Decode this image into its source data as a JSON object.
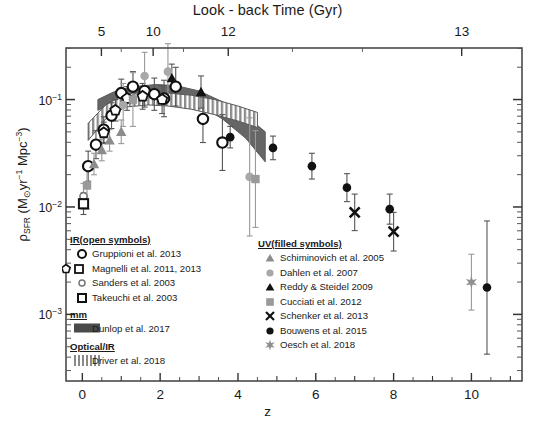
{
  "chart_data": {
    "type": "scatter",
    "title": "Look - back Time (Gyr)",
    "xlabel": "z",
    "ylabel_parts": {
      "rho": "ρ",
      "sfr": "SFR",
      "units_open": " (M",
      "sun": "⊙",
      "yr": "yr",
      "yr_exp": "-1",
      "mpc": " Mpc",
      "mpc_exp": "-3",
      "units_close": ")"
    },
    "xlim": [
      -0.42,
      11.3
    ],
    "ylim_log": [
      -3.62,
      -0.52
    ],
    "xticks_major": [
      0,
      2,
      4,
      6,
      8,
      10
    ],
    "xticks_minor": [
      1,
      3,
      5,
      7,
      9,
      11
    ],
    "xtick_labels": [
      "0",
      "2",
      "4",
      "6",
      "8",
      "10"
    ],
    "yticks_major_log": [
      -1,
      -2,
      -3
    ],
    "ytick_labels": [
      "10⁻¹",
      "10⁻²",
      "10⁻³"
    ],
    "top_axis": {
      "label": "Look - back Time (Gyr)",
      "ticks_z": [
        0.49,
        1.82,
        3.75,
        9.75
      ],
      "tick_labels": [
        "5",
        "10",
        "12",
        "13"
      ],
      "minor_ticks_z": [
        1.0,
        2.6,
        5.4,
        7.2
      ]
    },
    "grid": false,
    "legend_position": "inside-lower-left and inside-lower-center",
    "bands": [
      {
        "name": "Dunlop et al. 2017",
        "style": "dark-gray-filled",
        "color": "#595959",
        "upper_log": [
          [
            0.4,
            -1.0
          ],
          [
            0.8,
            -0.93
          ],
          [
            1.3,
            -0.88
          ],
          [
            1.9,
            -0.86
          ],
          [
            2.4,
            -0.87
          ],
          [
            3.0,
            -0.92
          ],
          [
            3.6,
            -1.02
          ],
          [
            4.2,
            -1.15
          ],
          [
            4.7,
            -1.3
          ]
        ],
        "lower_log": [
          [
            0.4,
            -1.1
          ],
          [
            0.8,
            -1.03
          ],
          [
            1.3,
            -0.98
          ],
          [
            1.9,
            -0.96
          ],
          [
            2.4,
            -0.98
          ],
          [
            3.0,
            -1.05
          ],
          [
            3.6,
            -1.18
          ],
          [
            4.2,
            -1.36
          ],
          [
            4.7,
            -1.58
          ]
        ]
      },
      {
        "name": "Driver et al. 2018",
        "style": "vertical-hatch",
        "color": "#7a7a7a",
        "upper_log": [
          [
            0.15,
            -1.22
          ],
          [
            0.6,
            -1.05
          ],
          [
            1.1,
            -0.95
          ],
          [
            1.7,
            -0.93
          ],
          [
            2.2,
            -0.94
          ],
          [
            2.8,
            -0.96
          ],
          [
            3.4,
            -1.0
          ],
          [
            4.0,
            -1.06
          ],
          [
            4.5,
            -1.12
          ]
        ],
        "lower_log": [
          [
            0.15,
            -1.38
          ],
          [
            0.6,
            -1.18
          ],
          [
            1.1,
            -1.07
          ],
          [
            1.7,
            -1.05
          ],
          [
            2.2,
            -1.06
          ],
          [
            2.8,
            -1.09
          ],
          [
            3.4,
            -1.14
          ],
          [
            4.0,
            -1.2
          ],
          [
            4.5,
            -1.26
          ]
        ]
      }
    ],
    "series": [
      {
        "name": "Gruppioni et al. 2013",
        "group": "IR (open symbols)",
        "marker": "open-circle",
        "color": "#111111",
        "points": [
          {
            "z": 0.15,
            "log_y": -1.62,
            "err_lo": 0.14,
            "err_hi": 0.14
          },
          {
            "z": 0.35,
            "log_y": -1.42,
            "err_lo": 0.13,
            "err_hi": 0.13
          },
          {
            "z": 0.55,
            "log_y": -1.28,
            "err_lo": 0.12,
            "err_hi": 0.12
          },
          {
            "z": 0.75,
            "log_y": -1.15,
            "err_lo": 0.12,
            "err_hi": 0.12
          },
          {
            "z": 1.0,
            "log_y": -0.94,
            "err_lo": 0.13,
            "err_hi": 0.13
          },
          {
            "z": 1.3,
            "log_y": -0.88,
            "err_lo": 0.14,
            "err_hi": 0.14
          },
          {
            "z": 1.6,
            "log_y": -0.92,
            "err_lo": 0.15,
            "err_hi": 0.15
          },
          {
            "z": 1.85,
            "log_y": -0.95,
            "err_lo": 0.15,
            "err_hi": 0.15
          },
          {
            "z": 2.1,
            "log_y": -0.99,
            "err_lo": 0.17,
            "err_hi": 0.17
          },
          {
            "z": 2.4,
            "log_y": -0.88,
            "err_lo": 0.18,
            "err_hi": 0.18
          },
          {
            "z": 3.1,
            "log_y": -1.18,
            "err_lo": 0.22,
            "err_hi": 0.22
          },
          {
            "z": 3.6,
            "log_y": -1.4,
            "err_lo": 0.26,
            "err_hi": 0.26
          }
        ]
      },
      {
        "name": "Magnelli et al. 2011, 2013",
        "group": "IR (open symbols)",
        "marker": "open-pentagon",
        "color": "#111111",
        "points": [
          {
            "z": 0.55,
            "log_y": -1.31,
            "err_lo": 0.1,
            "err_hi": 0.1
          },
          {
            "z": 0.85,
            "log_y": -1.1,
            "err_lo": 0.1,
            "err_hi": 0.1
          },
          {
            "z": 1.15,
            "log_y": -0.99,
            "err_lo": 0.11,
            "err_hi": 0.11
          },
          {
            "z": 1.55,
            "log_y": -0.97,
            "err_lo": 0.12,
            "err_hi": 0.12
          },
          {
            "z": 2.05,
            "log_y": -1.0,
            "err_lo": 0.13,
            "err_hi": 0.13
          }
        ]
      },
      {
        "name": "Sanders et al. 2003",
        "group": "IR (open symbols)",
        "marker": "open-circle-small",
        "color": "#777777",
        "points": [
          {
            "z": 0.03,
            "log_y": -1.9,
            "err_lo": 0.12,
            "err_hi": 0.12
          }
        ]
      },
      {
        "name": "Takeuchi et al. 2003",
        "group": "IR (open symbols)",
        "marker": "open-square",
        "color": "#111111",
        "points": [
          {
            "z": 0.03,
            "log_y": -1.97,
            "err_lo": 0.1,
            "err_hi": 0.1
          }
        ]
      },
      {
        "name": "Schiminovich et al. 2005",
        "group": "UV (filled symbols)",
        "marker": "filled-triangle",
        "color": "#8c8c8c",
        "points": [
          {
            "z": 0.3,
            "log_y": -1.6,
            "err_lo": 0.1,
            "err_hi": 0.1
          },
          {
            "z": 0.5,
            "log_y": -1.47,
            "err_lo": 0.1,
            "err_hi": 0.1
          },
          {
            "z": 0.7,
            "log_y": -1.38,
            "err_lo": 0.1,
            "err_hi": 0.1
          },
          {
            "z": 1.0,
            "log_y": -1.3,
            "err_lo": 0.11,
            "err_hi": 0.11
          }
        ]
      },
      {
        "name": "Dahlen et al. 2007",
        "group": "UV (filled symbols)",
        "marker": "filled-circle-gray",
        "color": "#a8a8a8",
        "points": [
          {
            "z": 1.05,
            "log_y": -1.05,
            "err_lo": 0.2,
            "err_hi": 0.2
          },
          {
            "z": 1.6,
            "log_y": -0.78,
            "err_lo": 0.22,
            "err_hi": 0.22
          },
          {
            "z": 2.2,
            "log_y": -0.74,
            "err_lo": 0.26,
            "err_hi": 0.26
          },
          {
            "z": 4.3,
            "log_y": -1.72,
            "err_lo": 0.55,
            "err_hi": 0.55
          }
        ]
      },
      {
        "name": "Reddy & Steidel 2009",
        "group": "UV (filled symbols)",
        "marker": "filled-triangle-dark",
        "color": "#111111",
        "points": [
          {
            "z": 2.3,
            "log_y": -0.8,
            "err_lo": 0.13,
            "err_hi": 0.13
          },
          {
            "z": 3.05,
            "log_y": -0.93,
            "err_lo": 0.15,
            "err_hi": 0.15
          }
        ]
      },
      {
        "name": "Cucciati et al. 2012",
        "group": "UV (filled symbols)",
        "marker": "filled-square-gray",
        "color": "#9a9a9a",
        "points": [
          {
            "z": 0.12,
            "log_y": -1.8,
            "err_lo": 0.22,
            "err_hi": 0.22
          },
          {
            "z": 1.3,
            "log_y": -1.0,
            "err_lo": 0.25,
            "err_hi": 0.25
          },
          {
            "z": 4.45,
            "log_y": -1.74,
            "err_lo": 0.45,
            "err_hi": 0.45
          }
        ]
      },
      {
        "name": "Schenker et al. 2013",
        "group": "UV (filled symbols)",
        "marker": "cross-x",
        "color": "#111111",
        "points": [
          {
            "z": 7.0,
            "log_y": -2.05,
            "err_lo": 0.17,
            "err_hi": 0.17
          },
          {
            "z": 8.0,
            "log_y": -2.23,
            "err_lo": 0.18,
            "err_hi": 0.18
          }
        ]
      },
      {
        "name": "Bouwens et al. 2015",
        "group": "UV (filled symbols)",
        "marker": "filled-circle",
        "color": "#111111",
        "points": [
          {
            "z": 3.8,
            "log_y": -1.35,
            "err_lo": 0.1,
            "err_hi": 0.1
          },
          {
            "z": 4.9,
            "log_y": -1.45,
            "err_lo": 0.11,
            "err_hi": 0.11
          },
          {
            "z": 5.9,
            "log_y": -1.62,
            "err_lo": 0.12,
            "err_hi": 0.12
          },
          {
            "z": 6.8,
            "log_y": -1.82,
            "err_lo": 0.13,
            "err_hi": 0.13
          },
          {
            "z": 7.9,
            "log_y": -2.02,
            "err_lo": 0.14,
            "err_hi": 0.14
          },
          {
            "z": 10.4,
            "log_y": -2.75,
            "err_lo": 0.62,
            "err_hi": 0.62
          }
        ]
      },
      {
        "name": "Oesch et al. 2018",
        "group": "UV (filled symbols)",
        "marker": "star-gray",
        "color": "#8f8f8f",
        "points": [
          {
            "z": 10.0,
            "log_y": -2.7,
            "err_lo": 0.26,
            "err_hi": 0.26
          }
        ]
      }
    ]
  },
  "legend_left": {
    "sections": [
      {
        "heading": "IR(open symbols)",
        "rows": [
          {
            "marker": "open-circle",
            "label": "Gruppioni et al. 2013"
          },
          {
            "marker": "pentagon-square",
            "label": "Magnelli et al. 2011, 2013"
          },
          {
            "marker": "open-circle-small",
            "label": "Sanders et al. 2003"
          },
          {
            "marker": "open-square",
            "label": "Takeuchi et al. 2003"
          }
        ]
      },
      {
        "heading": "mm",
        "rows": [
          {
            "marker": "dark-band",
            "label": "Dunlop et al. 2017"
          }
        ]
      },
      {
        "heading": "Optical/IR",
        "rows": [
          {
            "marker": "hatch-band",
            "label": "Driver et al. 2018"
          }
        ]
      }
    ]
  },
  "legend_right": {
    "sections": [
      {
        "heading": "UV(filled symbols)",
        "rows": [
          {
            "marker": "filled-triangle",
            "label": "Schiminovich et al. 2005"
          },
          {
            "marker": "filled-circle-gray",
            "label": "Dahlen et al. 2007"
          },
          {
            "marker": "filled-triangle-dark",
            "label": "Reddy & Steidel 2009"
          },
          {
            "marker": "filled-square-gray",
            "label": "Cucciati et al. 2012"
          },
          {
            "marker": "cross-x",
            "label": "Schenker et al. 2013"
          },
          {
            "marker": "filled-circle",
            "label": "Bouwens et al. 2015"
          },
          {
            "marker": "star-gray",
            "label": "Oesch et al. 2018"
          }
        ]
      }
    ]
  }
}
